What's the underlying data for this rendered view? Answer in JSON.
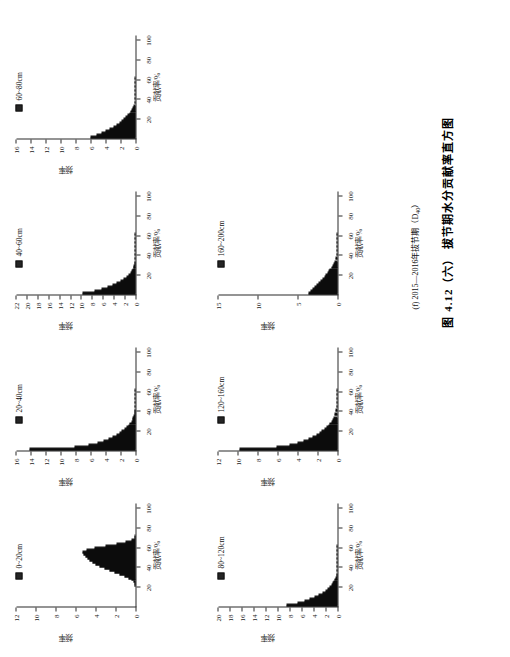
{
  "figure": {
    "main_caption": "图 4.12（六）  拔节期水分贡献率直方图",
    "sub_caption_prefix": "(f) 2015—2016年拔节期（D",
    "sub_caption_sub": "40",
    "sub_caption_suffix": "）",
    "axis_x_label": "贡献率/%",
    "axis_y_label": "频率",
    "ink_color": "#181818"
  },
  "chart_data": [
    {
      "type": "bar",
      "title": "0~20cm",
      "xlabel": "贡献率/%",
      "ylabel": "频率",
      "xlim": [
        0,
        105
      ],
      "ylim": [
        0,
        12
      ],
      "xticks": [
        20,
        40,
        60,
        80,
        100
      ],
      "yticks": [
        0,
        2,
        4,
        6,
        8,
        10,
        12
      ],
      "bin_width": 2,
      "x": [
        20,
        22,
        24,
        26,
        28,
        30,
        32,
        34,
        36,
        38,
        40,
        42,
        44,
        46,
        48,
        50,
        52,
        54,
        56,
        58,
        60,
        62,
        64,
        66,
        68,
        70
      ],
      "values": [
        0.05,
        0.12,
        0.25,
        0.45,
        0.75,
        1.15,
        1.6,
        2.1,
        2.6,
        3.1,
        3.6,
        4.0,
        4.35,
        4.6,
        4.8,
        5.0,
        5.2,
        5.3,
        4.9,
        4.1,
        3.0,
        1.9,
        1.0,
        0.45,
        0.15,
        0.04
      ]
    },
    {
      "type": "bar",
      "title": "20~40cm",
      "xlabel": "贡献率/%",
      "ylabel": "频率",
      "xlim": [
        0,
        105
      ],
      "ylim": [
        0,
        16
      ],
      "xticks": [
        20,
        40,
        60,
        80,
        100
      ],
      "yticks": [
        0,
        2,
        4,
        6,
        8,
        10,
        12,
        14,
        16
      ],
      "bin_width": 2,
      "x": [
        0,
        2,
        4,
        6,
        8,
        10,
        12,
        14,
        16,
        18,
        20,
        22,
        24,
        26,
        28,
        30,
        32,
        34,
        36,
        38,
        40,
        44,
        48,
        52,
        56,
        60
      ],
      "values": [
        14.2,
        8.2,
        6.3,
        5.1,
        4.3,
        3.6,
        3.1,
        2.6,
        2.2,
        1.85,
        1.5,
        1.2,
        0.95,
        0.75,
        0.58,
        0.45,
        0.34,
        0.26,
        0.2,
        0.15,
        0.11,
        0.07,
        0.045,
        0.03,
        0.02,
        0.012
      ]
    },
    {
      "type": "bar",
      "title": "40~60cm",
      "xlabel": "贡献率/%",
      "ylabel": "频率",
      "xlim": [
        0,
        105
      ],
      "ylim": [
        0,
        22
      ],
      "xticks": [
        20,
        40,
        60,
        80,
        100
      ],
      "yticks": [
        0,
        2,
        4,
        6,
        8,
        10,
        12,
        14,
        16,
        18,
        20,
        22
      ],
      "bin_width": 2,
      "x": [
        0,
        2,
        4,
        6,
        8,
        10,
        12,
        14,
        16,
        18,
        20,
        22,
        24,
        26,
        28,
        30,
        32,
        36,
        40,
        44,
        48,
        52,
        56,
        60
      ],
      "values": [
        9.8,
        7.6,
        6.2,
        5.2,
        4.3,
        3.5,
        2.8,
        2.2,
        1.7,
        1.3,
        1.0,
        0.75,
        0.55,
        0.42,
        0.3,
        0.22,
        0.16,
        0.1,
        0.06,
        0.04,
        0.025,
        0.015,
        0.01,
        0.006
      ]
    },
    {
      "type": "bar",
      "title": "60~80cm",
      "xlabel": "贡献率/%",
      "ylabel": "频率",
      "xlim": [
        0,
        105
      ],
      "ylim": [
        0,
        16
      ],
      "xticks": [
        20,
        40,
        60,
        80,
        100
      ],
      "yticks": [
        0,
        2,
        4,
        6,
        8,
        10,
        12,
        14,
        16
      ],
      "bin_width": 2,
      "x": [
        0,
        2,
        4,
        6,
        8,
        10,
        12,
        14,
        16,
        18,
        20,
        22,
        24,
        26,
        28,
        30,
        32,
        36,
        40,
        44,
        48,
        52,
        56,
        60
      ],
      "values": [
        6.0,
        5.2,
        4.6,
        4.0,
        3.5,
        3.0,
        2.6,
        2.2,
        1.85,
        1.55,
        1.28,
        1.05,
        0.85,
        0.68,
        0.54,
        0.42,
        0.33,
        0.2,
        0.12,
        0.075,
        0.045,
        0.028,
        0.017,
        0.01
      ]
    },
    {
      "type": "bar",
      "title": "80~120cm",
      "xlabel": "贡献率/%",
      "ylabel": "频率",
      "xlim": [
        0,
        105
      ],
      "ylim": [
        0,
        20
      ],
      "xticks": [
        20,
        40,
        60,
        80,
        100
      ],
      "yticks": [
        0,
        2,
        4,
        6,
        8,
        10,
        12,
        14,
        16,
        18,
        20
      ],
      "bin_width": 2,
      "x": [
        0,
        2,
        4,
        6,
        8,
        10,
        12,
        14,
        16,
        18,
        20,
        22,
        24,
        26,
        28,
        30,
        32,
        36,
        40,
        44,
        48,
        52,
        56,
        60
      ],
      "values": [
        8.5,
        6.8,
        5.6,
        4.7,
        3.9,
        3.2,
        2.6,
        2.1,
        1.65,
        1.3,
        1.0,
        0.78,
        0.6,
        0.45,
        0.34,
        0.25,
        0.18,
        0.1,
        0.06,
        0.035,
        0.02,
        0.012,
        0.008,
        0.005
      ]
    },
    {
      "type": "bar",
      "title": "120~160cm",
      "xlabel": "贡献率/%",
      "ylabel": "频率",
      "xlim": [
        0,
        105
      ],
      "ylim": [
        0,
        12
      ],
      "xticks": [
        20,
        40,
        60,
        80,
        100
      ],
      "yticks": [
        0,
        2,
        4,
        6,
        8,
        10,
        12
      ],
      "bin_width": 2,
      "x": [
        0,
        2,
        4,
        6,
        8,
        10,
        12,
        14,
        16,
        18,
        20,
        22,
        24,
        26,
        28,
        30,
        32,
        36,
        40,
        44,
        48,
        52,
        56,
        60
      ],
      "values": [
        9.9,
        6.2,
        4.8,
        4.0,
        3.4,
        2.9,
        2.5,
        2.15,
        1.85,
        1.6,
        1.35,
        1.15,
        0.95,
        0.8,
        0.65,
        0.53,
        0.42,
        0.27,
        0.17,
        0.1,
        0.06,
        0.035,
        0.02,
        0.012
      ]
    },
    {
      "type": "bar",
      "title": "160~200cm",
      "xlabel": "贡献率/%",
      "ylabel": "频率",
      "xlim": [
        0,
        105
      ],
      "ylim": [
        0,
        15
      ],
      "xticks": [
        20,
        40,
        60,
        80,
        100
      ],
      "yticks": [
        0,
        5,
        10,
        15
      ],
      "bin_width": 2,
      "x": [
        0,
        2,
        4,
        6,
        8,
        10,
        12,
        14,
        16,
        18,
        20,
        22,
        24,
        26,
        28,
        30,
        32,
        36,
        40,
        44,
        48,
        52,
        56,
        60
      ],
      "values": [
        3.7,
        3.4,
        3.1,
        2.85,
        2.6,
        2.35,
        2.1,
        1.9,
        1.7,
        1.5,
        1.3,
        1.12,
        0.95,
        0.8,
        0.66,
        0.54,
        0.43,
        0.27,
        0.16,
        0.09,
        0.05,
        0.03,
        0.018,
        0.01
      ]
    }
  ]
}
